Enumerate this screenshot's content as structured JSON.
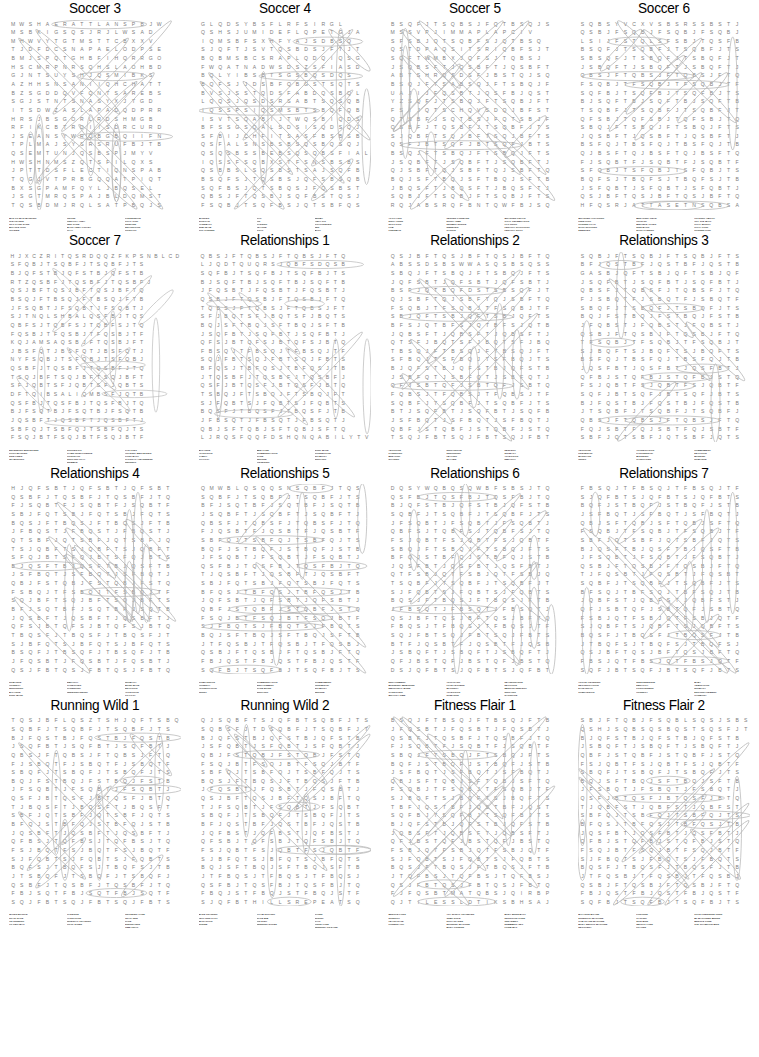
{
  "page": {
    "kind": "word-search-puzzle-sheet",
    "width": 759,
    "height": 1057,
    "background_color": "#ffffff",
    "letter_color": "#7d7d7d",
    "solution_outline_color": "#b6b6b6",
    "title_color": "#000000",
    "wordlist_color": "#1d1d1d",
    "grid_columns": 19,
    "grid_rows": 22,
    "puzzle_rows": 4,
    "puzzle_columns": 4,
    "puzzle_count": 16
  },
  "puzzles": [
    {
      "title": "Soccer 3",
      "grid": [
        "MWSHAERATTLANSPBJW",
        "MSBKIGSQSJRJLWSAD",
        "MHWVYTGTMSTTCBXXV",
        "TJDFDCSNAPAELODPSE",
        "BMJSPQTGHBFIHQRRGO",
        "HSCMRPNRSQHSLAOHBD",
        "GJNTSUYSHJQSMIBKS",
        "AZHHSNSANIIQHCHATT",
        "BZSGDDQVFQNTSAREBS",
        "SGJSTNTSNASYXJTGD",
        "ITSDWZASLAPADQDPRR",
        "HRSJBSGORLRDSHMGB",
        "RFIKCBTRDIISDRCURD",
        "JSEANSYWRQBGBQIIFN",
        "TPLMAJSYSRSRUFBJTB",
        "QSEMTUNJQSBSPJMYV",
        "HWSHNMSZQTSFILQXS",
        "JPTTDSFLECTIQNSPAB",
        "TQGJVTPRBGQQATPIQT",
        "BXSGPAMFQYLJBQSEL",
        "JSGTMRQSPAJBLDQMST",
        "TQSBDMJRQLSATPBQJS"
      ],
      "words": [
        [
          "MAN TO MAN MARKING",
          "CLEARANCE",
          "TIFO CARD SANS",
          "BICYCLE KICK",
          "OFFSIDE"
        ],
        [
          "CROSS",
          "PENALTY AREA",
          "RED CARD",
          "BACK HEEL VOLLEY",
          "PLAY"
        ],
        [
          "POSSESSION",
          "GOAL KICK",
          "SIDELINE",
          "DEFLECTION",
          "CONTACT"
        ]
      ]
    },
    {
      "title": "Soccer 4",
      "grid": [
        "GLQDSYBSFLRFSIRGL",
        "QSHSJUMIDEFLQPETGJA",
        "IQMSBFSXHFYAJSDBSQ",
        "SJQFTJSVTQSBDSJFTJT",
        "BQBMSBCSRAPLQDQIQSG",
        "FWQATNADWSDSZSFIASD",
        "BQLYIBSBTSGSBQSDQS",
        "BQFSJJDSBFQBGSTSQTS",
        "BVSJSSTQDSFABDQSBQL",
        "LQQSJQSDSRSABTSQSQB",
        "IQSSPSIQSMSBTSBQFQB",
        "ISVTSQABIJTWQSBIQDS",
        "BFSSGSQALSDSISQDSQJ",
        "SFBIJCHFITSASFBSBSB",
        "QSFALSNSBSBSQSBQSQJ",
        "QSQSBSSBEBSQSQBSFIAL",
        "IQSSFSQBXSTFSNSBSBS",
        "QSBBSLSQSBSTSAJSQFB",
        "BSQFSJTQSBSJQFSBSQB",
        "SQFBSJQTSBQSJFQSBST",
        "QBSJFTQSBJSQFBSTQSJ",
        "FSQBJTSQFBSJQTSBFQS"
      ],
      "words": [
        [
          "MARKER",
          "SHIN PAD",
          "HANDBALL",
          "SUB TEAM",
          "TOP CORNER"
        ],
        [
          "CAP",
          "ON",
          "PASSING",
          "LEAGUE",
          "GOAL"
        ],
        [
          "DERBY",
          "AWAY KIT",
          "GOALKEEPER",
          "WIN",
          "BALL"
        ]
      ]
    },
    {
      "title": "Soccer 5",
      "grid": [
        "BSQFJTSQBSJFQTBSQJS",
        "MSSVPJIMMAPLAPCIV",
        "SFSBJQTSQBFSJQTBSQ",
        "QSTDPAQSITSRIQBFSJT",
        "SQFTWMBXJQFSJTQBSJ",
        "JSQBSFTJQSBFTJQSBFT",
        "ABTSHRQSDSFJBSTQJSQ",
        "BSQJFTSABSQJFTSBQJF",
        "UAJIJFQSBTJQSFBJQST",
        "YZSQFJTSBQJFTSQBJFT",
        "FSIJQTSCHQVSDQJBFST",
        "QTSBFJSQTBSJFQTSBJF",
        "QSBFJTQSBFJTSQBFJTS",
        "SJQBFTSQJBFTSQJBFTS",
        "QSFJBTSQFJBTSQFJBTS",
        "BSQJFTSBQJFTSBQJFTS",
        "JSQBFTJSQBFTJSQBFTJ",
        "QJSBFTQJSBFTQJSBFTQ",
        "BQJSFTBQJSFTBQJSFTB",
        "JBQSFTJBQSFTJBQSFTJ",
        "SQBJFTSQBJFTSQBJFTS",
        "RQJABSRQFBNTQWFBJSQ"
      ],
      "words": [
        [
          "AT PLAYER",
          "DIRTY TURN",
          "SPOT KICK",
          "LOB",
          "LINESMAN"
        ],
        [
          "CENTER FORWARD",
          "EXTRA TIME",
          "NUTMEG STRIKE",
          "SWEEPER",
          "TACKLE"
        ],
        [
          "QUARTER FINALS",
          "GOAL CELEBRATION",
          "HAT TRICK",
          "PENALTY SHOOTOUT",
          "PENALTY SPOT"
        ]
      ]
    },
    {
      "title": "Soccer 6",
      "grid": [
        "SQBSYVCXVSBSRSSBSTJ",
        "QSBJFSQBJFSQBJFSQBJ",
        "LSIJFSTQLSFSBJTQSFB",
        "BSQFJTSQBFJTSQBFJTS",
        "SBSQFJTSBQFJTSBQFJT",
        "JSBQFTJSBQFTJSBQFTJ",
        "QBSJFTQBSJFTQBSJFTQ",
        "FSQBJTFSQBJTFSQBJTF",
        "SQFBJTSQFBJTSQFBJTS",
        "BJSQFTBJSQFTBJSQFTB",
        "TSQBFJTSQBFJTSQBFJT",
        "QFSBJTQFSBJTQFSBJTQ",
        "SBQJFTSBQJFTSBQJFTS",
        "JQSBFTJQSBFTJQSBFTJ",
        "BSFQJTBSFQJTBSFQJTB",
        "QJBSFTQJBSFTQJBSFTQ",
        "FJSQBTFJSQBTFJSQBTF",
        "SFQBJTSFQBJTSFQBJTS",
        "BQFSJTBQFSJTBQFSJTB",
        "JSFQBTJSFQBTJSFQBTJ",
        "QSJBFTQSJBFTQSJBFTQ",
        "HFQSRJATTASETNSQBSA"
      ],
      "words": [
        [
          "QUARTER ATTACKING",
          "FREE KICK",
          "CORNER FLAG",
          "SHOT STOPPER",
          "SWEEPER"
        ],
        [
          "BREAKING FIELD",
          "HOLD UP",
          "MIDFIELD AFTER",
          "SIDE BACK",
          "SHOT PASSING"
        ],
        [
          "HOLDING ABILITY",
          "OFF THE BALL",
          "GOAL MOUTH",
          "GOAL POST",
          "CORNER KICK"
        ]
      ]
    },
    {
      "title": "Soccer 7",
      "grid": [
        "HJXCZRITQSRDQQZFKPSNBLCD",
        "SFQBJTSQBFJTSQBFJTS",
        "BJQFSTBJQFSTBJQFSTB",
        "RTZQSBFJTQSBFJTQSBFJ",
        "QSJBFTQSJBFTQSJBFTQ",
        "BSQJFTBSQJFTBSQJFTB",
        "JFSQBTJFSQBTJFSQBTJ",
        "SJTNQLSHBALQSFBJTQS",
        "QBFSJTQBFSJTQBFSJTQ",
        "FQSBJTFQSBJTFQSBJTF",
        "KQJAMSAQSBJFTQSBJFT",
        "JBSFQTJBSFQTJBSFQTJ",
        "NYFSQBJTSFQBJTSFQBJ",
        "QSBFJTQSBFJTQSBFJTQ",
        "TSQJBFTSQJBFTSQJBFT",
        "SFJQBTSFJQBTSFJQBTS",
        "DFTQIBSALIQMBSFJQTB",
        "QSFBJTQSFBJTQSFBJTQ",
        "BJFSQTBJFSQTBJFSQTB",
        "JQSBFTJQSBFTJQSBFTJ",
        "SBFQJTSBFQJTSBFQJTS",
        "FSQJBTFSQJBTFSQJBTF"
      ],
      "words": [
        [
          "DEFENDING MIDFIELDER",
          "PITCH MARKER",
          "SIDE LINES",
          "TEAM SPIRIT"
        ],
        [
          "SOCCER KIT",
          "GAME INTELLIGENCE",
          "CONTRACT",
          "SUPPORT PLAY",
          "DRIBBLE"
        ],
        [
          "FAR POST",
          "HOLDING MIDFIELDER",
          "LONG BALL",
          "TACTICAL AWARENESS",
          "INDIRECT"
        ]
      ]
    },
    {
      "title": "Relationships 1",
      "grid": [
        "QBSJFTQBSJFTQBSJFTQ",
        "LJQDTQUQRSJQBFSDQSB",
        "SQFBJTSQFBJTSQFBJTS",
        "BJSQFTBJSQFTBJSQFTB",
        "JFQSBTJFQSBTJFQSBTJ",
        "QSBJFTQSBJFTQSBJFTQ",
        "TQBSJFTQBSJFTQBSJFT",
        "SFJBQTSFJBQTSFJBQTS",
        "BQJSFTBQJSFTBQJSFTB",
        "JSQFBTJSQFBTJSQFBTJ",
        "QFSJBTQFSJBTQFSJBTQ",
        "FBSQJTFBSQJTFBSQJTF",
        "SQJFBTSQJFBTSQJFBTS",
        "BFQSJTBFQSJTBFQSJTB",
        "JTQSBFJTQSBFJTQSBFJ",
        "QSFJBTQSFJBTQSFJBTQ",
        "TSBQJFTSBQJFTSBQJFT",
        "SJFQBTSJFQBTSJFQBTS",
        "BQSFJTBQSFJTBQSFJTB",
        "JFBSQTJFBSQTJFBSQTJ",
        "QBJSFTQBJSFTQBJSFTQ",
        "LJRQSFQQFDSHQNQABILYTV"
      ],
      "words": [
        [
          "BALANCE",
          "AFFECTION",
          "FAMILY",
          "LOYALTY"
        ],
        [
          "BED LAND",
          "COMMUNICATION",
          "CARE",
          "SECURE",
          "LISTENING"
        ],
        [
          "SOUL MATE",
          "CONNECTION",
          "STABILITY",
          "SUPPORT"
        ]
      ]
    },
    {
      "title": "Relationships 2",
      "grid": [
        "QSJBFTQSJBFTQSJBFTQ",
        "ABSSDSBSWWASQSBSQSS",
        "SBQJFTSBQJFTSBQJFTS",
        "JQFSBTJQFSBTJQFSBTJ",
        "BSFJQTBQFDSTSBSQFJT",
        "QJSBFTQJSBFTQJSBFTQ",
        "FSQBJTFSQBJTFSQBJTF",
        "SBJQFTSBJQFTSBJQFTS",
        "BFSJQTBFSJQTBFSJQTB",
        "JQBSFTJQBSFTJQBSFTJ",
        "QTSFJBQTSFJBQTSFJBQ",
        "TBSQJFTBSQJFTBSQJFT",
        "SFBQJTSFBQJTSFBQJTS",
        "BJQFSTBJQFSTBJQFSTB",
        "JSBFQTJSBFQTJSBFQTJ",
        "QFJSBTQFJSBTQFJSBTQ",
        "FQBSJTFQBSJTFQBSJTF",
        "SQBFJTSQBFJTSQBFJTS",
        "BTJSQFBTJSQFBTJSQFB",
        "JSFBQTJSFBQTJSFBQTJ",
        "QBFJSTQBFJSTQBFJSTQ",
        "TSQJFBTSQJFBTSQJFBT"
      ],
      "words": [
        [
          "ADOPTION",
          "PARENTING",
          "BREAKUP",
          "SHARING"
        ],
        [
          "SUPPORTIVE",
          "NURTURING",
          "HEALING",
          "IN LAWS"
        ],
        [
          "RESPECT",
          "INTIMACY",
          "AFFECTION",
          "EMPATHY"
        ]
      ]
    },
    {
      "title": "Relationships 3",
      "grid": [
        "SQBJFTSQBJFTSQBJFTS",
        "BFJQSTBFJQSTBFJQSTB",
        "GASBJQFTSBJQFTSBJQF",
        "JSQFBTJSQFBTJSQFBTJ",
        "QBSFJTQBSFJTQBSFJTQ",
        "FJSBQTFJSBQTFJSBQTF",
        "SBQFJTSBQFJTSBQFJTS",
        "BQJFSTBQJFSTBQJFSTB",
        "JFQBSTJFQBSTJFQBSTJ",
        "QSBJFTQSBJFTQSBJFTQ",
        "TFSQBJTFSQBJTFSQBJT",
        "SJBQFTSJBQFTSJBQFTS",
        "BSFQJTBSFQJTBSFQJTB",
        "JQSFBTJQSFBTJQSFBTJ",
        "QFBJSTQFBJSTQFBJSTQ",
        "FSJQBTFSJQBTFSJQBTF",
        "SQFJBTSQFJBTSQFJBTS",
        "BJFQSTBJFQSTBJFQSTB",
        "JTSQBFJTSQBFJTSQBFJ",
        "QBSJFTQBSJFTQBSJFTQ",
        "FQJSBTFQJSBTFQJSBTF",
        "SBFJQTSBFJQTSBFJQTS"
      ],
      "words": [
        [
          "ADOPTION",
          "FRIENDSHIP",
          "MARRIAGE",
          "TRUST"
        ],
        [
          "APPRECIATION",
          "PARTNERSHIP",
          "BLENDING",
          "CARETAKER"
        ],
        [
          "COMMITMENT",
          "DEVOTION",
          "BONDING",
          "ROMANCE"
        ]
      ]
    },
    {
      "title": "Relationships 4",
      "grid": [
        "HJQFSBTJQFSBTJQFSBT",
        "QSBFJTQSBFJTQSBFJTQ",
        "FJSQBTFJSQBTFJSQBTF",
        "SBJFQTSBJFQTSBJFQTS",
        "BQSJFTBQSJFTBQSJFTB",
        "JFBQSTJFBQSTJFBQSTJ",
        "QTSBFJQTSBFJQTSBFJQ",
        "TSJQBFTSJQBFTSJQBFT",
        "SFQJBTSFQJBTSFQJBTS",
        "BJQSFTBJQSFTBJQSFTB",
        "JSFBQTJSFBQTJSFBQTJ",
        "QBJFSTQBJFSTQBJFSTQ",
        "FSBQJTFSBQJTFSBQJTF",
        "SQJBFTSQJBFTSQJBFTS",
        "BFJSQTBFJSQTBFJSQTB",
        "JQSBFTJQSBFTJQSBFTJ",
        "QFSJBTQFSJBTQFSJBTQ",
        "TBQSFJTBQSFJTBQSFJT",
        "SJBFQTSJBFQTSJBFQTS",
        "BSQFJTBSQFJTBSQFJTB",
        "JFQSBTJFQSBTJFQSBTJ",
        "QSJFBTQSJFBTQSJFBTQ"
      ],
      "words": [
        [
          "ROMANCE",
          "HONESTY",
          "NURTURING",
          "BALANCE",
          "SOUL MATE"
        ],
        [
          "EMPATHY",
          "CAREGIVER",
          "PARENTING",
          "UNDERSTANDING"
        ],
        [
          "INTIMACY",
          "BOND MATE",
          "DEVOTION",
          "AFFECTION",
          "LOYALTY"
        ]
      ]
    },
    {
      "title": "Relationships 5",
      "grid": [
        "QMWBLQSQQSNSQBFJTQS",
        "SQBFJTSQBFJTSQBFJTS",
        "BFJSQTBFJSQTBFJSQTB",
        "JSQBFTJSQBFTJSQBFTJ",
        "QBSFJTQBSFJTQBSFJTQ",
        "FJQSBTFJQSBTFJQSBTF",
        "SBFQJTSBFQJTSBFQJTS",
        "BQFJSTBQFJSTBQFJSTB",
        "JFSQBTJFSQBTJFSQBTJ",
        "QSFBJTQSFBJTQSFBJTQ",
        "TJQSBFTJQSBFTJQSBFT",
        "SBJFQTSBJFQTSBJFQTS",
        "BFQSJTBFQSJTBFQSJTB",
        "JQFSBTJQFSBTJQFSBTJ",
        "QBFJSTQBFJSTQBFJSTQ",
        "FSQJBTFSQJBTFSQJBTF",
        "SJFBQTSJFBQTSJFBQTS",
        "BQJSFTBQJSFTBQJSFTB",
        "JTFQSBJTFQSBJTFQSBJ",
        "QSBJFTQSBJFTQSBJFTQ",
        "FBJQSTFBJQSTFBJQSTF",
        "SQFBJTSQFBJTSQFBJTS"
      ],
      "words": [
        [
          "COMPASSION",
          "HONESTY",
          "APPRECIATION",
          "TRUST"
        ],
        [
          "COMMUNICATION",
          "ENGAGEMENT",
          "CARE BOND",
          "SUPPORT"
        ],
        [
          "COMMITMENT",
          "FRIENDSHIP",
          "STABILITY",
          "SECURE"
        ]
      ]
    },
    {
      "title": "Relationships 6",
      "grid": [
        "DQSYWQBQSQWBFSBSJTQ",
        "QSFBJTQSFBJTQSFBJTQ",
        "BJQFSTBJQFSTBJQFSTB",
        "SQBFJTSQBFJTSQBFJTS",
        "JFSQBTJFSQBTJFSQBTJ",
        "QBFSJTQBFSJTQBFSJTQ",
        "FSJQBTFSJQBTFSJQBTF",
        "SBQJFTSBQJFTSBQJFTS",
        "BFQJSTBFQJSTBFQJSTB",
        "JQSFBTJQSFBTJQSFBTJ",
        "QTFSBJQTFSBJQTFSBJQ",
        "TSQBFJTSQBFJTSQBFJT",
        "SJFQBTSJFQBTSJFQBTS",
        "BQSJFTBQSJFTBQSJFTB",
        "JFBSQTJFBSQTJFBSQTJ",
        "QSJBFTQSJBFTQSJBFTQ",
        "FBQSJTFBQSJTFBQSJTF",
        "SQJFBTSQJFBTSQJFBTS",
        "BTFJQSBTFJQSBTFJQSB",
        "JSBQFTJSBQFTJSBQFTJ",
        "QFJBSTQFJBSTQFJBSTQ",
        "DSJQFBTSJQFBTSJQFBT"
      ],
      "words": [
        [
          "ENGAGEMENT",
          "BLENDING MEMORIES",
          "EMOTIONAL BOND",
          "CAREGIVER",
          "QUALITY TIME"
        ],
        [
          "APPLICANT",
          "LOVE LETTERS",
          "MATURITY",
          "AFFECTION",
          "ROMANCE"
        ],
        [
          "REASSURANCE",
          "DEVOTION",
          "MENTOR RESPECT",
          "SUPPORT",
          "SACRIFICE"
        ]
      ]
    },
    {
      "title": "Relationships 7",
      "grid": [
        "FBSQJTFBSQJTFBSQJTF",
        "SJQFBTSJQFBTSJQFBTS",
        "BQFJSTBQFJSTBQFJSTB",
        "JSFBQTJSFBQTJSFBQTJ",
        "QBJSFTQBJSFTQBJSFTQ",
        "FSQBJTFSQBJTFSQBJTF",
        "SBFJQTSBFJQTSBFJQTS",
        "BJQSFTBJQSFTBJQSFTB",
        "JFSQBTJFSQBTJFSQBTJ",
        "QSBJFTQSBJFTQSBJFTQ",
        "TJFQSBTJFQSBTJFQSBT",
        "SQBFJTSQBFJTSQBFJTS",
        "BFSQJTBFSQJTBFSQJTB",
        "JQBFSTJQBFSTJQBFSTJ",
        "QFJSBTQFJSBTQFJSBTQ",
        "FSBJQTFSBJQTFSBJQTF",
        "SJQBFTSJQBFTSJQBFTS",
        "BQSFJTBQSFJTBQSFJTB",
        "JTBQFSJTBQFSJTBQFSJ",
        "QSJBFTQSJBFTQSJBFTQ",
        "FBSJQTFBSJQTFBSJQTF",
        "SQFJBTSQFJBTSQFJBTS"
      ],
      "words": [
        [
          "ACTIVE LISTENING",
          "RECONCILIATION",
          "DATE NIGHT",
          "COMPASSION"
        ],
        [
          "INDEPENDENCE",
          "EQUALITY",
          "FORGIVENESS",
          "HONESTY"
        ],
        [
          "BABY",
          "ADMIRATION",
          "INTIMACY",
          "ENCOURAGEMENT",
          "HARMONY"
        ]
      ]
    },
    {
      "title": "Running Wild 1",
      "grid": [
        "TQSJBFLQSZTSHJQFTSBQ",
        "SQBFJTSQBFJTSQBFJTS",
        "BJFQSTBJFQSTBJFQSTB",
        "JSQFBTJSQFBTJSQFBTJ",
        "QBSJFTQBSJFTQBSJFTQ",
        "FJSBQTFJSBQTFJSBQTF",
        "SBQFJTSBQFJTSBQFJTS",
        "BQJFSTBQJFSTBQJFSTB",
        "JFSQBTJFSQBTJFSQBTJ",
        "QSFJBTQSFJBTQSFJBTQ",
        "TJBQSFTJBQSFTJBQSFT",
        "SBFJQTSBFJQTSBFJQTS",
        "BFQJSTBFQJSTBFQJSTB",
        "JQSBFTJQSBFTJQSBFTJ",
        "QFBSJTQFBSJTQFBSJTQ",
        "FSJBQTFSJBQTFSJBQTF",
        "SJFQBTSJFQBTSJFQBTS",
        "BQFSJTBQFSJTBQFSJTB",
        "JTSBQFJTSBQFJTSBQFJ",
        "QSBFJTQSBFJTQSBFJTQ",
        "FBJSQTFBJSQTFBJSQTF",
        "SQJFBTSQJFBTSQJFBTS"
      ],
      "words": [
        [
          "WATER BOTTLE",
          "ROAD RACE",
          "ON RUNNING",
          "VO TWO MAX"
        ],
        [
          "CADENCE",
          "HYDRATION",
          "INTERVAL TRAINING",
          "COOL DOWN"
        ],
        [
          "CROSSING LANE",
          "TRAIL RUN",
          "PACE",
          "ENDURANCE",
          "TIME TRIAL"
        ]
      ]
    },
    {
      "title": "Running Wild 2",
      "grid": [
        "QJSQBFTSJQFBTSQBFJTS",
        "SQBSFJTDSQBFJTSQBFJT",
        "BJQFSTBJQFSTBJQFSTB",
        "JSFQBTJSFQBTJSFQBTJ",
        "QBJFSTQBJFSTQBJFSTQ",
        "FSQJBTFSQJBTFSQJBTF",
        "SBFQJTSBFQJTSBFQJTS",
        "BQSJFTBQSJFTBQSJFTB",
        "JFQSBTJFQSBTJFQSBTJ",
        "QSJBFTQSJBFTQSJBFTQ",
        "TJFSQBTJFSQBTJFSQBT",
        "SBQFJTSBQFJTSBQFJTS",
        "BFJQSTBFJQSTBFJQSTB",
        "JQFBSTJQFBSTJQFBSTJ",
        "QFSBJTQFSBJTQFSBJTQ",
        "FSJQBTFSJQBTFSJQBTF",
        "SJBFQTSJBFQTSJBFQTS",
        "BQJSFTBQJSFTBQJSFTB",
        "JTFBQSJTFBQSJTFBQSJ",
        "QSFBJTQSFBJTQSFBJTQ",
        "FBQJSTFBQJSTFBQJSTF",
        "SJQFBTHILLSREPEATSQ"
      ],
      "words": [
        [
          "BASE TRAINING",
          "FELL RUN PATH",
          "MARATHON",
          "STRIDE"
        ],
        [
          "FOAM ROLLING",
          "RACE BIB",
          "FIN DISH",
          "RUNNING SHOES"
        ],
        [
          "TAPER",
          "SPRINT",
          "GAIT",
          "FINISH LINE",
          "RUNNING ON SAND"
        ]
      ]
    },
    {
      "title": "Fitness Flair 1",
      "grid": [
        "BSQJFTBSQJFTBSQJFTB",
        "JFQSBTJFQSBTJFQSBTJ",
        "QSBFJTQSBFJTQSBFJTQ",
        "FJSQBTFJSQBTFJSQBTF",
        "SBQJFTSBQJFTSBQJFTS",
        "BQFJSTBQFJSTBQFJSTB",
        "JSFBQTJSFBQTJSFBQTJ",
        "QBJSFTQBJSFTQBJSFTQ",
        "FSQBJTFSQBJTFSQBJTF",
        "SJBQFTSJBQFTSJBQFTS",
        "TBFJQSTBFJQSTBFJQST",
        "SQFBJTSQFBJTSQFBJTS",
        "BJQFSTBJQFSTBJQFSTB",
        "JQBSFTJQBSFTJQBSFTJ",
        "QFJBSTQFJBSTQFJBSTQ",
        "FSBJQTFSBJQTFSBJQTF",
        "SJFQBTSJFQBTSJFQBTS",
        "BQSJFTBQSJFTBQSJFTB",
        "JTQFBSJTQFBSJTQFBSJ",
        "QSJFBTQSJFBTQSJFBTQ",
        "FJFQSBTMATQBSJQIRBP",
        "QJTILESSLDTIKSBHSAJ"
      ],
      "words": [
        [
          "MUSCLE LOSS",
          "STRETCH",
          "HEART RATE",
          "FITNESS APP"
        ],
        [
          "ALL SPINAL TRANSFER",
          "JUMP ROPE",
          "ROLL UP SIDE",
          "MORNING MACHINE",
          "BODY FITNESS"
        ],
        [
          "BODY BURN BALL",
          "NUTRITION CORE",
          "TREADMILL",
          "DUMBBELL SET",
          "FORM MAT"
        ]
      ]
    },
    {
      "title": "Fitness Flair 2",
      "grid": [
        "SBJFTQBJFSQBLSQSJSBS",
        "QSHJSQBSQSBQSTSQSFJT",
        "BJQFSTBJQFSTBJQFSTB",
        "JSBQFTJSBQFTJSBQFTJ",
        "QBFJSTQBFJSTQBFJSTQ",
        "FSJQBTFSJQBTFSJQBTF",
        "SBQFJTSBQFJTSBQFJTS",
        "BQJSFTBQJSFTBQJSFTB",
        "JFSBQTJFSBQTJFSBQTJ",
        "QSFJBTQSFJBTQSFJBTQ",
        "TJQBFSTJQBFSTJQBFST",
        "SBFQJTSBFQJTSBFQJTS",
        "BFQSJTBFQSJTBFQSJTB",
        "JQSFBTJQSFBTJQSFBTJ",
        "QFBJSTQFBJSTQFBJSTQ",
        "FSQJBTFSQJBTFSQJBTF",
        "SJFBQTSJFBQTSJFBQTS",
        "BQSFJTBQSFJTBQSFJTB",
        "JTFQSBJTFQSBJTFQSBJ",
        "QSBJFTQSBJFTQSBJFTQ",
        "FBJQSTFBJQSTFBJQSTF",
        "SQFBJTSQFBJTSQFBJTS"
      ],
      "words": [
        [
          "BALANCE BOARD",
          "STRENGTH MACHINE",
          "GYM CLASS MACHINE",
          "BODY WEIGHT MACHINE",
          "RECOVERY"
        ],
        [
          "POSTURE",
          "CYCLING",
          "SPIN BIKE",
          "WEIGHT LOSS",
          "PILATES"
        ],
        [
          "COLD PRESSURE TURN",
          "BP MACHINES BURNS",
          "MUSCLE TONE",
          "THE CHAMPION BIKE"
        ]
      ]
    }
  ]
}
